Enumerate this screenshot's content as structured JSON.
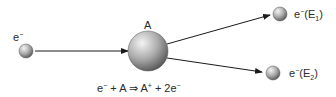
{
  "diagram": {
    "incoming_electron": {
      "label": "e",
      "charge": "−"
    },
    "atom": {
      "label": "A"
    },
    "outgoing": [
      {
        "label": "e",
        "charge": "−",
        "energy": "E",
        "energy_sub": "1"
      },
      {
        "label": "e",
        "charge": "−",
        "energy": "E",
        "energy_sub": "2"
      }
    ],
    "equation": {
      "e": "e",
      "e_sup": "−",
      "plus1": " + A ⇒ A",
      "a_sup": "+",
      "plus2": " + 2e",
      "e2_sup": "−"
    },
    "colors": {
      "line": "#1a1a1a",
      "sphere_light": "#f2f2f2",
      "sphere_mid": "#a8a8a8",
      "sphere_dark": "#5a5a5a"
    }
  }
}
